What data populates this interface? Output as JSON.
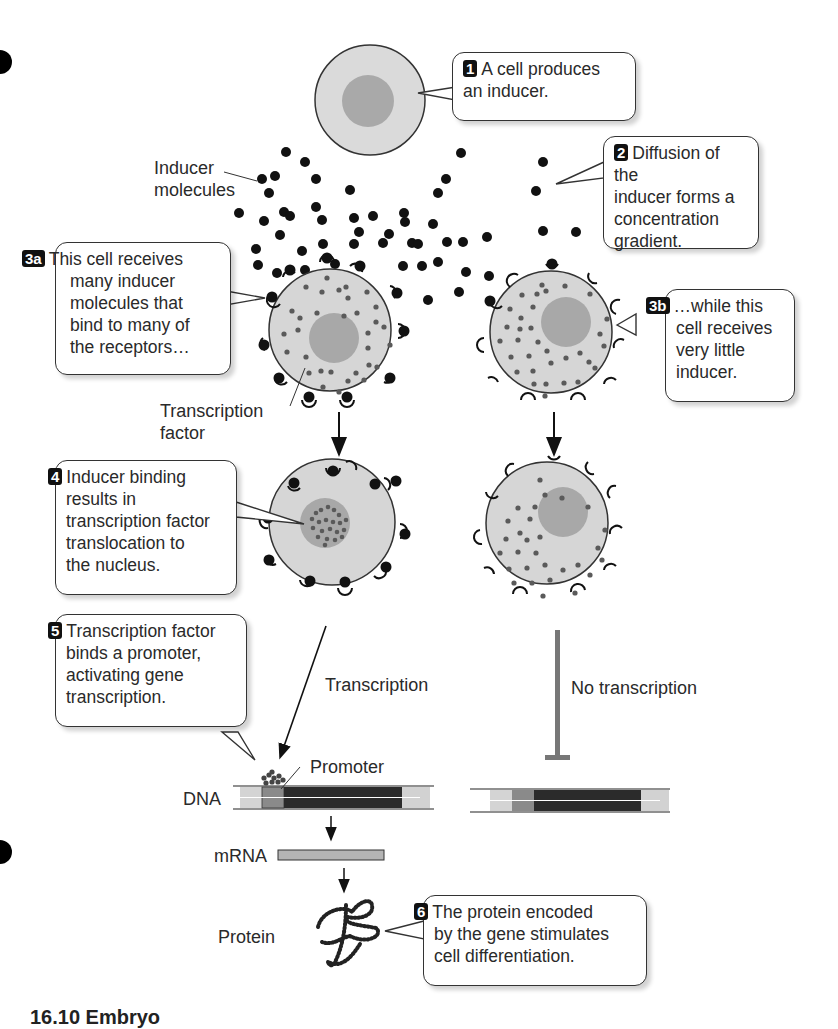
{
  "diagram": {
    "steps": [
      {
        "id": "1",
        "badge": "1",
        "text_lines": [
          "A cell produces",
          "an inducer."
        ]
      },
      {
        "id": "2",
        "badge": "2",
        "text_lines": [
          "Diffusion of the",
          "inducer forms a",
          "concentration",
          "gradient."
        ]
      },
      {
        "id": "3a",
        "badge": "3a",
        "text_lines": [
          "This cell receives",
          "many inducer",
          "molecules that",
          "bind to many of",
          "the receptors…"
        ]
      },
      {
        "id": "3b",
        "badge": "3b",
        "text_lines": [
          "…while this",
          "cell receives",
          "very little",
          "inducer."
        ]
      },
      {
        "id": "4",
        "badge": "4",
        "text_lines": [
          "Inducer binding",
          "results in",
          "transcription factor",
          "translocation to",
          "the nucleus."
        ]
      },
      {
        "id": "5",
        "badge": "5",
        "text_lines": [
          "Transcription factor",
          "binds a promoter,",
          "activating gene",
          "transcription."
        ]
      },
      {
        "id": "6",
        "badge": "6",
        "text_lines": [
          "The protein encoded",
          "by the gene stimulates",
          "cell differentiation."
        ]
      }
    ],
    "labels": {
      "inducer_molecules": [
        "Inducer",
        "molecules"
      ],
      "transcription_factor": [
        "Transcription",
        "factor"
      ],
      "transcription": "Transcription",
      "no_transcription": "No transcription",
      "promoter": "Promoter",
      "dna": "DNA",
      "mrna": "mRNA",
      "protein": "Protein"
    },
    "caption_partial": "16.10  Embryo"
  },
  "colors": {
    "cytoplasm": "#d6d6d6",
    "nucleus": "#a8a8a8",
    "inducer": "#111111",
    "transcription_factor": "#5a5a5a",
    "dna_gene": "#2b2b2b",
    "dna_promoter": "#8a8a8a",
    "dna_flank": "#d0d0d0",
    "mrna": "#b4b4b4",
    "inhibit_bar": "#777777"
  }
}
